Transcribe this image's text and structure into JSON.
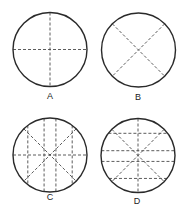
{
  "figure": {
    "panels": [
      {
        "label": "A",
        "lines": {
          "vertical": [
            0
          ],
          "horizontal": [
            0
          ],
          "diagonals": false
        }
      },
      {
        "label": "B",
        "lines": {
          "vertical": [],
          "horizontal": [],
          "diagonals": true
        }
      },
      {
        "label": "C",
        "lines": {
          "vertical": [
            -0.6,
            -0.16,
            0.16,
            0.6
          ],
          "horizontal": [
            0
          ],
          "diagonals": true
        }
      },
      {
        "label": "D",
        "lines": {
          "vertical": [
            0
          ],
          "horizontal": [
            -0.6,
            -0.13,
            0.16,
            0.62
          ],
          "diagonals": true
        }
      }
    ],
    "colors": {
      "outline": "#2a2a2a",
      "dashed": "#4a4a4a"
    }
  }
}
